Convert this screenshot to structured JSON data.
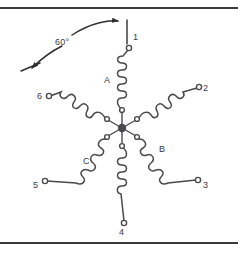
{
  "figure": {
    "background_color": "#ffffff",
    "line_color": "#4a4a4d",
    "rule_color": "#3a3a3c",
    "caption_text": ""
  },
  "annotation": {
    "angle_label": "60°",
    "angle_degrees": 60,
    "from_terminal": "1",
    "to_terminal": "6"
  },
  "hub": {
    "label": "",
    "terminal_count": 6
  },
  "terminals": [
    {
      "id": "t1",
      "label": "1",
      "angle_deg": 90,
      "x": 129,
      "y": 45
    },
    {
      "id": "t2",
      "label": "2",
      "angle_deg": 30,
      "x": 201,
      "y": 86
    },
    {
      "id": "t3",
      "label": "3",
      "angle_deg": -30,
      "x": 201,
      "y": 183
    },
    {
      "id": "t4",
      "label": "4",
      "angle_deg": -90,
      "x": 120,
      "y": 227
    },
    {
      "id": "t5",
      "label": "5",
      "angle_deg": 210,
      "x": 41,
      "y": 183
    },
    {
      "id": "t6",
      "label": "6",
      "angle_deg": 150,
      "x": 44,
      "y": 96
    }
  ],
  "coils": [
    {
      "id": "coil-a",
      "phase_label": "A",
      "terminal": "1",
      "label_x": 104,
      "label_y": 79
    },
    {
      "id": "coil-b",
      "phase_label": "B",
      "terminal": "3",
      "label_x": 160,
      "label_y": 148
    },
    {
      "id": "coil-c",
      "phase_label": "C",
      "terminal": "5",
      "label_x": 84,
      "label_y": 160
    }
  ]
}
